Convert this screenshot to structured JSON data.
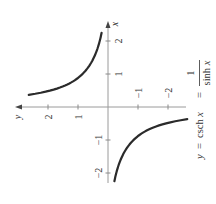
{
  "chart_data": {
    "type": "line",
    "equation": {
      "lhs": "y",
      "eq1": "=",
      "middle": "csch x",
      "eq2": "=",
      "numerator": "1",
      "denominator": "sinh x"
    },
    "xlabel": "x",
    "ylabel": "y",
    "orientation": "rotated 90° counterclockwise (x-axis vertical, y-axis horizontal)",
    "xlim": [
      -2.3,
      2.6
    ],
    "ylim": [
      -2.6,
      3.0
    ],
    "x_ticks": [
      {
        "value": -2,
        "label": "−2"
      },
      {
        "value": -1,
        "label": "−1"
      },
      {
        "value": 1,
        "label": "1"
      },
      {
        "value": 2,
        "label": "2"
      }
    ],
    "y_ticks": [
      {
        "value": -2,
        "label": "−2"
      },
      {
        "value": -1,
        "label": "−1"
      },
      {
        "value": 1,
        "label": "1"
      },
      {
        "value": 2,
        "label": "2"
      }
    ],
    "grid": false,
    "legend": null,
    "series": [
      {
        "name": "csch x (x > 0 branch)",
        "x": [
          0.37,
          0.5,
          0.75,
          1.0,
          1.25,
          1.5,
          1.75,
          2.0,
          2.25
        ],
        "values": [
          2.62,
          1.92,
          1.22,
          0.85,
          0.62,
          0.47,
          0.36,
          0.28,
          0.21
        ]
      },
      {
        "name": "csch x (x < 0 branch)",
        "x": [
          -2.25,
          -2.0,
          -1.75,
          -1.5,
          -1.25,
          -1.0,
          -0.75,
          -0.5,
          -0.37
        ],
        "values": [
          -0.21,
          -0.28,
          -0.36,
          -0.47,
          -0.62,
          -0.85,
          -1.22,
          -1.92,
          -2.62
        ]
      }
    ],
    "colors": {
      "curve": "#2b2b2b",
      "axis": "#9a9a9a",
      "text": "#333333"
    }
  }
}
